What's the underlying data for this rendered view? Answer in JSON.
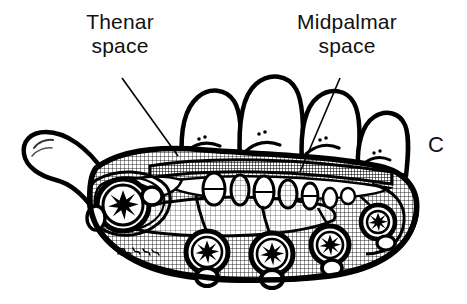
{
  "figure": {
    "panel_letter": "C",
    "artist_signature": "R. Alb",
    "palette": {
      "ink": "#000000",
      "background": "#ffffff",
      "shading": "#7a7a7a"
    }
  },
  "labels": {
    "thenar": {
      "line1": "Thenar",
      "line2": "space"
    },
    "midpalmar": {
      "line1": "Midpalmar",
      "line2": "space"
    }
  },
  "leader_lines": [
    {
      "name": "thenar-leader",
      "from": [
        122,
        78
      ],
      "to": [
        178,
        156
      ]
    },
    {
      "name": "midpalmar-leader",
      "from": [
        340,
        78
      ],
      "to": [
        300,
        172
      ]
    }
  ],
  "anatomy": {
    "fingers": [
      {
        "name": "index-finger",
        "height_rank": 2
      },
      {
        "name": "middle-finger",
        "height_rank": 1
      },
      {
        "name": "ring-finger",
        "height_rank": 3
      },
      {
        "name": "little-finger",
        "height_rank": 4
      }
    ],
    "thumb": {
      "name": "thumb",
      "position": "left"
    },
    "metacarpals": [
      {
        "name": "first-metacarpal"
      },
      {
        "name": "second-metacarpal"
      },
      {
        "name": "third-metacarpal"
      },
      {
        "name": "fourth-metacarpal"
      },
      {
        "name": "fifth-metacarpal"
      }
    ],
    "flexor_tendon_sheaths": 6
  }
}
